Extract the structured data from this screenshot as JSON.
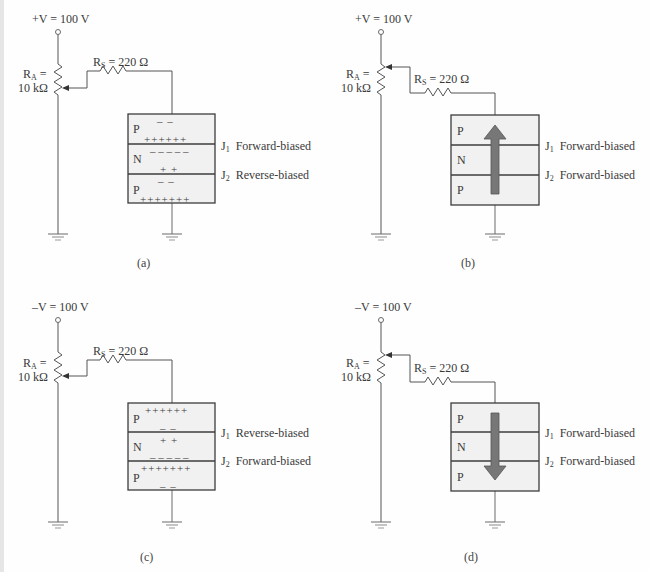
{
  "panels": [
    {
      "id": "a",
      "caption": "(a)",
      "supply": "+V = 100 V",
      "ra_label": "R",
      "ra_sub": "A",
      "ra_eq": " =",
      "ra_value": "10 kΩ",
      "rs_label": "R",
      "rs_sub": "S",
      "rs_value": " = 220 Ω",
      "layers": [
        "P",
        "N",
        "P"
      ],
      "junctions": [
        {
          "name": "J",
          "sub": "1",
          "state": "Forward-biased"
        },
        {
          "name": "J",
          "sub": "2",
          "state": "Reverse-biased"
        }
      ],
      "charges": {
        "p1_top": "– –",
        "p1_bottom": "++++++",
        "n_top": "– – – – –",
        "n_bottom": "+ +",
        "p2_top": "– –",
        "p2_bottom": "+++++++"
      },
      "current_arrow": "none"
    },
    {
      "id": "b",
      "caption": "(b)",
      "supply": "+V = 100 V",
      "ra_label": "R",
      "ra_sub": "A",
      "ra_eq": " =",
      "ra_value": "10 kΩ",
      "rs_label": "R",
      "rs_sub": "S",
      "rs_value": " = 220 Ω",
      "layers": [
        "P",
        "N",
        "P"
      ],
      "junctions": [
        {
          "name": "J",
          "sub": "1",
          "state": "Forward-biased"
        },
        {
          "name": "J",
          "sub": "2",
          "state": "Forward-biased"
        }
      ],
      "current_arrow": "up"
    },
    {
      "id": "c",
      "caption": "(c)",
      "supply": "–V = 100 V",
      "ra_label": "R",
      "ra_sub": "A",
      "ra_eq": " =",
      "ra_value": "10 kΩ",
      "rs_label": "R",
      "rs_sub": "S",
      "rs_value": " = 220 Ω",
      "layers": [
        "P",
        "N",
        "P"
      ],
      "junctions": [
        {
          "name": "J",
          "sub": "1",
          "state": "Reverse-biased"
        },
        {
          "name": "J",
          "sub": "2",
          "state": "Forward-biased"
        }
      ],
      "charges": {
        "p1_top": "++++++",
        "p1_bottom": "– –",
        "n_top": "+ +",
        "n_bottom": "– – – – –",
        "p2_top": "+++++++",
        "p2_bottom": "– –"
      },
      "current_arrow": "none"
    },
    {
      "id": "d",
      "caption": "(d)",
      "supply": "–V = 100 V",
      "ra_label": "R",
      "ra_sub": "A",
      "ra_eq": " =",
      "ra_value": "10 kΩ",
      "rs_label": "R",
      "rs_sub": "S",
      "rs_value": " = 220 Ω",
      "layers": [
        "P",
        "N",
        "P"
      ],
      "junctions": [
        {
          "name": "J",
          "sub": "1",
          "state": "Forward-biased"
        },
        {
          "name": "J",
          "sub": "2",
          "state": "Forward-biased"
        }
      ],
      "current_arrow": "down"
    }
  ],
  "colors": {
    "wire": "#6a6a6a",
    "box_outline": "#3c3c3c",
    "box_fill": "#f1f1f1",
    "arrow": "#777777"
  }
}
